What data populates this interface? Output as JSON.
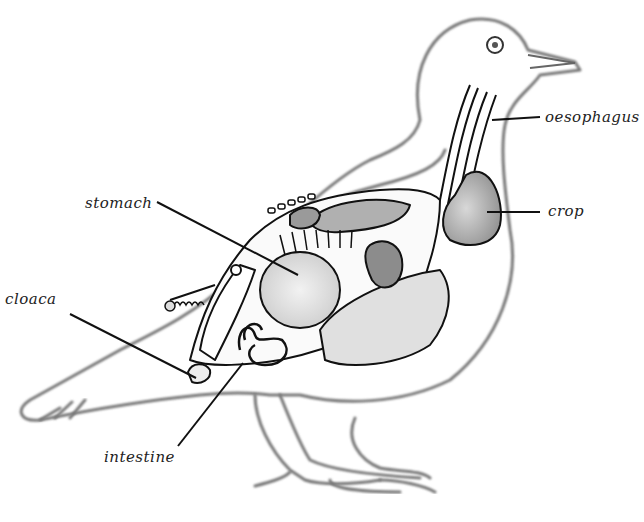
{
  "diagram": {
    "labels": [
      {
        "id": "oesophagus",
        "text": "oesophagus"
      },
      {
        "id": "crop",
        "text": "crop"
      },
      {
        "id": "stomach",
        "text": "stomach"
      },
      {
        "id": "cloaca",
        "text": "cloaca"
      },
      {
        "id": "intestine",
        "text": "intestine"
      }
    ],
    "colors": {
      "background": "#ffffff",
      "outline": "#777777",
      "organ_stroke": "#111111",
      "organ_fill_light": "#e6e6e6",
      "organ_fill_mid": "#bdbdbd",
      "organ_fill_dark": "#8a8a8a"
    }
  }
}
